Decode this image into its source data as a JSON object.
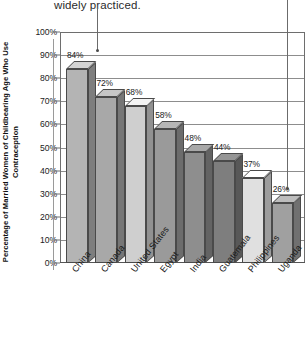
{
  "caption": {
    "text": "widely practiced."
  },
  "chart_data": {
    "type": "bar",
    "title": "",
    "xlabel": "",
    "ylabel": "Percentage of Married Women of Childbearing Age Who Use Contraception",
    "ylim": [
      0,
      100
    ],
    "ytick_labels": [
      "100%",
      "90%",
      "80%",
      "70%",
      "60%",
      "50%",
      "40%",
      "30%",
      "20%",
      "10%",
      "0%"
    ],
    "ytick_values": [
      100,
      90,
      80,
      70,
      60,
      50,
      40,
      30,
      20,
      10,
      0
    ],
    "grid": true,
    "legend": "none",
    "categories": [
      "China",
      "Canada",
      "United States",
      "Egypt",
      "India",
      "Guatemala",
      "Philippines",
      "Uganda"
    ],
    "values": [
      84,
      72,
      68,
      58,
      48,
      44,
      37,
      26
    ],
    "data_labels": [
      "84%",
      "72%",
      "68%",
      "58%",
      "48%",
      "44%",
      "37%",
      "26%"
    ],
    "bar_colors": [
      "#b4b4b4",
      "#a8a8a8",
      "#cfcfcf",
      "#9a9a9a",
      "#8e8e8e",
      "#7e7e7e",
      "#e0e0e0",
      "#a0a0a0"
    ],
    "annotations": [
      {
        "name": "leader-line-left",
        "target": "China"
      },
      {
        "name": "leader-line-right",
        "target": "Uganda"
      }
    ]
  }
}
